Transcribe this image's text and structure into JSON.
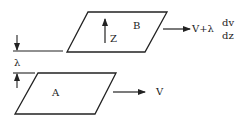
{
  "diagram": {
    "plane_top": {
      "label": "B"
    },
    "plane_bottom": {
      "label": "A"
    },
    "z_axis": {
      "label": "Z"
    },
    "spacing": {
      "label": "λ"
    },
    "velocity_top": {
      "prefix": "V+λ",
      "frac_num": "dv",
      "frac_den": "dz"
    },
    "velocity_bottom": {
      "label": "V"
    },
    "colors": {
      "stroke": "#222222",
      "background": "#ffffff"
    }
  }
}
